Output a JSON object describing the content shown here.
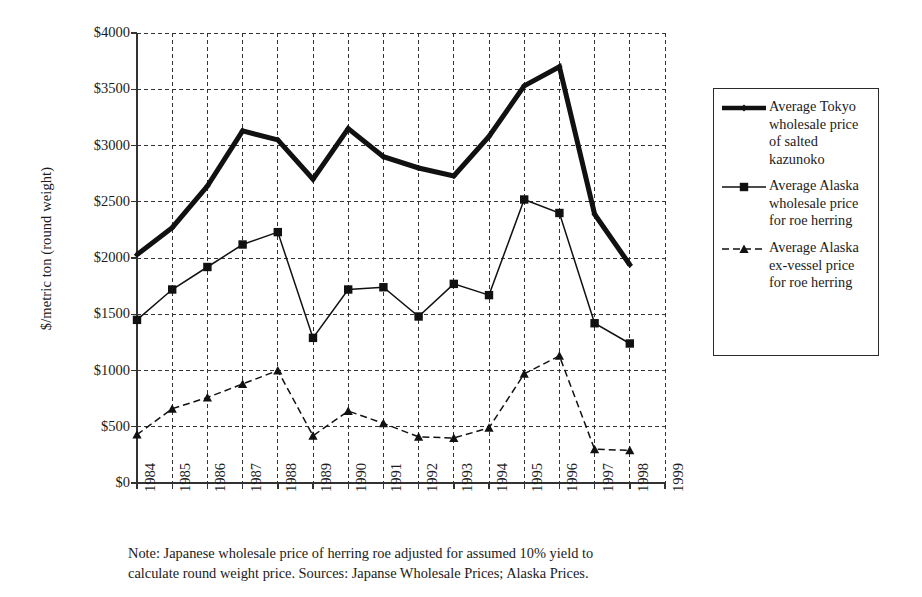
{
  "chart_data": {
    "type": "line",
    "title": "",
    "xlabel": "",
    "ylabel": "$/metric ton (round weight)",
    "x": [
      1984,
      1985,
      1986,
      1987,
      1988,
      1989,
      1990,
      1991,
      1992,
      1993,
      1994,
      1995,
      1996,
      1997,
      1998,
      1999
    ],
    "xtick_labels": [
      "1984",
      "1985",
      "1986",
      "1987",
      "1988",
      "1989",
      "1990",
      "1991",
      "1992",
      "1993",
      "1994",
      "1995",
      "1996",
      "1997",
      "1998",
      "1999"
    ],
    "ytick_labels": [
      "$0",
      "$500",
      "$1000",
      "$1500",
      "$2000",
      "$2500",
      "$3000",
      "$3500",
      "$4000"
    ],
    "ytick_values": [
      0,
      500,
      1000,
      1500,
      2000,
      2500,
      3000,
      3500,
      4000
    ],
    "ylim": [
      0,
      4000
    ],
    "xlim": [
      1984,
      1999
    ],
    "grid": true,
    "grid_style": "dashed",
    "legend_position": "right-outside",
    "series": [
      {
        "name": "Average Tokyo wholesale price of salted kazunoko",
        "marker": "diamond",
        "line_style": "solid",
        "line_width": 5,
        "color": "#111111",
        "x": [
          1984,
          1985,
          1986,
          1987,
          1988,
          1989,
          1990,
          1991,
          1992,
          1993,
          1994,
          1995,
          1996,
          1997,
          1998
        ],
        "values": [
          2030,
          2270,
          2640,
          3130,
          3050,
          2700,
          3150,
          2900,
          2800,
          2730,
          3080,
          3530,
          3700,
          2390,
          1940
        ]
      },
      {
        "name": "Average Alaska wholesale price for roe herring",
        "marker": "square",
        "line_style": "solid",
        "line_width": 1.5,
        "color": "#111111",
        "x": [
          1984,
          1985,
          1986,
          1987,
          1988,
          1989,
          1990,
          1991,
          1992,
          1993,
          1994,
          1995,
          1996,
          1997,
          1998
        ],
        "values": [
          1450,
          1720,
          1920,
          2120,
          2230,
          1290,
          1720,
          1740,
          1480,
          1770,
          1670,
          2520,
          2400,
          1420,
          1240
        ]
      },
      {
        "name": "Average Alaska ex-vessel price for roe herring",
        "marker": "triangle",
        "line_style": "dashed",
        "line_width": 1.5,
        "color": "#111111",
        "x": [
          1984,
          1985,
          1986,
          1987,
          1988,
          1989,
          1990,
          1991,
          1992,
          1993,
          1994,
          1995,
          1996,
          1997,
          1998
        ],
        "values": [
          430,
          660,
          760,
          880,
          1000,
          420,
          640,
          530,
          410,
          400,
          490,
          970,
          1130,
          300,
          290
        ]
      }
    ]
  },
  "legend": {
    "entries": [
      {
        "label": "Average Tokyo wholesale price of salted kazunoko",
        "marker": "diamond",
        "style": "thick-solid"
      },
      {
        "label": "Average Alaska wholesale price for roe herring",
        "marker": "square",
        "style": "thin-solid"
      },
      {
        "label": "Average Alaska ex-vessel price for roe herring",
        "marker": "triangle",
        "style": "dashed"
      }
    ]
  },
  "footnote": {
    "line1": "Note:  Japanese wholesale price of herring roe adjusted for assumed 10% yield to",
    "line2": "calculate round weight price.  Sources:  Japanse Wholesale Prices; Alaska Prices."
  }
}
